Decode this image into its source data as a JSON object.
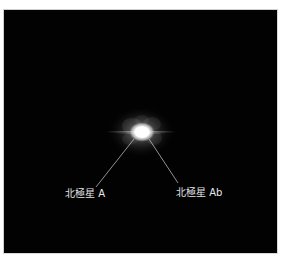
{
  "image": {
    "subject": "Polaris star system",
    "background_color": "#020202",
    "frame_border_color": "#cfcfcf"
  },
  "labels": {
    "polaris_a": "北極星 A",
    "polaris_ab": "北極星 Ab"
  },
  "colors": {
    "star_core": "#ffffff",
    "star_glow": "#bdbdbd",
    "label_text": "#e6e6e6",
    "pointer_line": "#cfcfcf"
  }
}
